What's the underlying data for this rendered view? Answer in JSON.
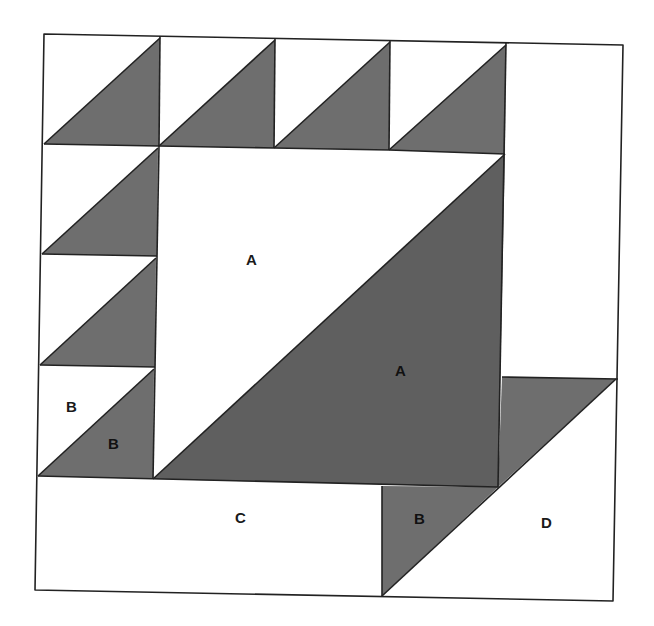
{
  "diagram": {
    "colors": {
      "shaded": "#6e6e6e",
      "background": "#ffffff",
      "outline": "#222222"
    },
    "labels": {
      "a_light": "A",
      "a_dark": "A",
      "b_light": "B",
      "b_dark_left": "B",
      "c": "C",
      "b_dark_bottom": "B",
      "d": "D"
    },
    "pieces": [
      {
        "id": "top-row-1",
        "type": "half-square-triangle"
      },
      {
        "id": "top-row-2",
        "type": "half-square-triangle"
      },
      {
        "id": "top-row-3",
        "type": "half-square-triangle"
      },
      {
        "id": "top-row-4",
        "type": "half-square-triangle"
      },
      {
        "id": "top-right-plain",
        "type": "rectangle"
      },
      {
        "id": "left-col-1",
        "type": "half-square-triangle"
      },
      {
        "id": "left-col-2",
        "type": "half-square-triangle"
      },
      {
        "id": "left-col-3",
        "type": "half-square-triangle",
        "labels": [
          "B",
          "B"
        ]
      },
      {
        "id": "center",
        "type": "half-square-triangle",
        "labels": [
          "A",
          "A"
        ]
      },
      {
        "id": "bottom-left",
        "type": "rectangle",
        "label": "C"
      },
      {
        "id": "bottom-right",
        "type": "parallelogram-split",
        "labels": [
          "B",
          "D"
        ]
      }
    ]
  }
}
